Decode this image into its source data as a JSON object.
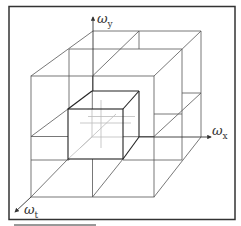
{
  "figure": {
    "type": "3d-grid-diagram",
    "axes": {
      "x": {
        "symbol": "ω",
        "subscript": "x"
      },
      "y": {
        "symbol": "ω",
        "subscript": "y"
      },
      "t": {
        "symbol": "ω",
        "subscript": "t"
      }
    },
    "colors": {
      "frame": "#333333",
      "grid": "#555555",
      "inner_cube": "#222222",
      "hidden_lines": "#bbbbbb"
    }
  }
}
